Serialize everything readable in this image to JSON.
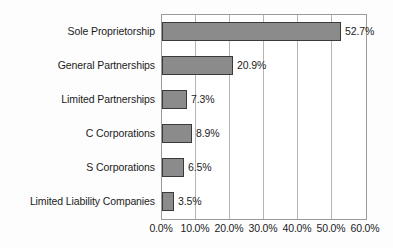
{
  "chart_data": {
    "type": "bar",
    "orientation": "horizontal",
    "title": "",
    "subtitle": "",
    "xlabel": "",
    "ylabel": "",
    "categories": [
      "Sole Proprietorship",
      "General Partnerships",
      "Limited Partnerships",
      "C Corporations",
      "S Corporations",
      "Limited Liability Companies"
    ],
    "values": [
      52.7,
      20.9,
      7.3,
      8.9,
      6.5,
      3.5
    ],
    "data_labels": [
      "52.7%",
      "20.9%",
      "7.3%",
      "8.9%",
      "6.5%",
      "3.5%"
    ],
    "xlim": [
      0,
      60
    ],
    "xticks": [
      0,
      10,
      20,
      30,
      40,
      50,
      60
    ],
    "xtick_labels": [
      "0.0%",
      "10.0%",
      "20.0%",
      "30.0%",
      "40.0%",
      "50.0%",
      "60.0%"
    ],
    "grid": true,
    "grid_axis": "x",
    "legend": false,
    "legend_position": "none",
    "colors": {
      "bar_fill": "#8b8b8b",
      "bar_border": "#3a3a3a",
      "gridline": "#b4b4b4",
      "plot_border": "#9a9a9a",
      "text": "#1c1c1c",
      "background": "#fdfdfd",
      "plot_background": "#ffffff"
    }
  }
}
